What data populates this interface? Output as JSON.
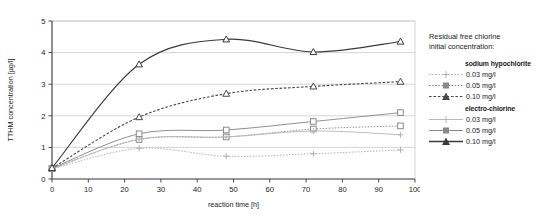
{
  "chart_data": {
    "type": "line",
    "title": "",
    "xlabel": "reaction time [h]",
    "ylabel": "TTHM concentration [µg/l]",
    "xlim": [
      0,
      100
    ],
    "ylim": [
      0,
      5
    ],
    "xticks": [
      0,
      10,
      20,
      30,
      40,
      50,
      60,
      70,
      80,
      90,
      100
    ],
    "yticks": [
      0,
      1,
      2,
      3,
      4,
      5
    ],
    "grid": "horizontal",
    "legend_position": "right",
    "x": [
      0,
      24,
      48,
      72,
      96
    ],
    "series": [
      {
        "name": "sodium hypochlorite 0.03 mg/l",
        "group": "sodium hypochlorite",
        "concentration": "0.03 mg/l",
        "values": [
          0.32,
          0.97,
          0.72,
          0.8,
          0.92
        ],
        "line_style": "dotted",
        "marker": "plus",
        "color": "#b0b0b0"
      },
      {
        "name": "sodium hypochlorite 0.05 mg/l",
        "group": "sodium hypochlorite",
        "concentration": "0.05 mg/l",
        "values": [
          0.33,
          1.25,
          1.33,
          1.58,
          1.68
        ],
        "line_style": "dotted",
        "marker": "square",
        "color": "#8a8a8a"
      },
      {
        "name": "sodium hypochlorite 0.10 mg/l",
        "group": "sodium hypochlorite",
        "concentration": "0.10 mg/l",
        "values": [
          0.34,
          1.96,
          2.7,
          2.93,
          3.08
        ],
        "line_style": "dashed",
        "marker": "triangle",
        "color": "#4a4a4a"
      },
      {
        "name": "electro-chlorine 0.03 mg/l",
        "group": "electro-chlorine",
        "concentration": "0.03 mg/l",
        "values": [
          0.32,
          1.26,
          1.33,
          1.52,
          1.4
        ],
        "line_style": "solid",
        "marker": "plus",
        "color": "#b8b8b8"
      },
      {
        "name": "electro-chlorine 0.05 mg/l",
        "group": "electro-chlorine",
        "concentration": "0.05 mg/l",
        "values": [
          0.34,
          1.43,
          1.55,
          1.82,
          2.1
        ],
        "line_style": "solid",
        "marker": "square",
        "color": "#8a8a8a"
      },
      {
        "name": "electro-chlorine 0.10 mg/l",
        "group": "electro-chlorine",
        "concentration": "0.10 mg/l",
        "values": [
          0.35,
          3.63,
          4.42,
          4.02,
          4.35
        ],
        "line_style": "solid",
        "marker": "triangle",
        "color": "#3a3a3a"
      }
    ]
  },
  "legend": {
    "title": "Residual free chlorine\ninitial concentration:",
    "groups": [
      {
        "head": "sodium hypochlorite",
        "items": [
          {
            "label": "0.03 mg/l"
          },
          {
            "label": "0.05 mg/l"
          },
          {
            "label": "0.10 mg/l"
          }
        ]
      },
      {
        "head": "electro-chlorine",
        "items": [
          {
            "label": "0.03 mg/l"
          },
          {
            "label": "0.05 mg/l"
          },
          {
            "label": "0.10 mg/l"
          }
        ]
      }
    ]
  }
}
